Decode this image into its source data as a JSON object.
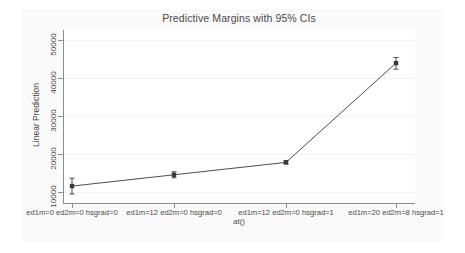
{
  "chart_data": {
    "type": "line",
    "title": "Predictive Margins with 95% CIs",
    "xlabel": "at()",
    "ylabel": "Linear Prediction",
    "categories": [
      "ed1m=0 ed2m=0 hsgrad=0",
      "ed1m=12 ed2m=0 hsgrad=0",
      "ed1m=12 ed2m=0 hsgrad=1",
      "ed1m=20 ed2m=8 hsgrad=1"
    ],
    "values": [
      10500,
      13500,
      16800,
      43200
    ],
    "ci_low": [
      8400,
      12700,
      16400,
      41600
    ],
    "ci_high": [
      12600,
      14300,
      17300,
      44700
    ],
    "ylim": [
      6000,
      52000
    ],
    "yticks": [
      10000,
      20000,
      30000,
      40000,
      50000
    ],
    "ytick_labels": [
      "10000",
      "20000",
      "30000",
      "40000",
      "50000"
    ],
    "grid": true,
    "legend": null,
    "series_color": "#4d4d4d",
    "marker_color": "#3a3a3a",
    "grid_color": "#f2f2f2",
    "axis_color": "#8d8d8d",
    "text_color": "#4a4a4a",
    "figure_background": "#fafafa",
    "plot_background": "#ffffff"
  }
}
